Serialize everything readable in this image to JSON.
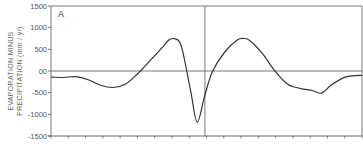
{
  "chart_data": {
    "type": "line",
    "title": "",
    "panel_label": "A",
    "xlabel": "",
    "ylabel_line1": "EVAPORATION MINUS",
    "ylabel_line2": "PRECIPITATION (mm / yr)",
    "ylim": [
      -1500,
      1500
    ],
    "yticks": [
      1500,
      1000,
      500,
      0,
      -500,
      -1000,
      -1500
    ],
    "ytick_labels": [
      "1500",
      "1000",
      "500",
      "00",
      "-500",
      "-1000",
      "-1500"
    ],
    "xtick_count": 19,
    "xtick_labels": [],
    "grid": false,
    "reference_lines": {
      "horizontal_zero": true,
      "vertical_at_fraction": 0.495
    },
    "series": [
      {
        "name": "E - P",
        "x_fraction": [
          0.0,
          0.04,
          0.08,
          0.12,
          0.16,
          0.2,
          0.24,
          0.28,
          0.32,
          0.36,
          0.38,
          0.4,
          0.42,
          0.45,
          0.47,
          0.495,
          0.52,
          0.56,
          0.6,
          0.62,
          0.64,
          0.68,
          0.72,
          0.76,
          0.8,
          0.84,
          0.87,
          0.9,
          0.94,
          0.97,
          1.0
        ],
        "values": [
          -140,
          -150,
          -130,
          -200,
          -330,
          -380,
          -300,
          -50,
          250,
          560,
          720,
          740,
          550,
          -500,
          -1180,
          -550,
          0,
          450,
          720,
          750,
          700,
          400,
          0,
          -300,
          -400,
          -450,
          -510,
          -330,
          -160,
          -110,
          -100
        ]
      }
    ]
  },
  "colors": {
    "line": "#333333",
    "axis": "#555555",
    "background": "#ffffff"
  }
}
